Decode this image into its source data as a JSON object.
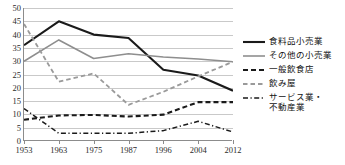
{
  "chart_data": {
    "type": "line",
    "title": "",
    "xlabel": "",
    "ylabel": "",
    "ylim": [
      0,
      50
    ],
    "ytick_step": 5,
    "yticks": [
      "0",
      "5",
      "10",
      "15",
      "20",
      "25",
      "30",
      "35",
      "40",
      "45",
      "50"
    ],
    "grid": true,
    "legend_position": "right",
    "categories": [
      "1953",
      "1963",
      "1975",
      "1987",
      "1996",
      "2004",
      "2012"
    ],
    "series": [
      {
        "name": "食料品小売業",
        "style": "solid",
        "color": "#1a1a1a",
        "width": 2.1,
        "values": [
          36.0,
          45.0,
          40.0,
          38.7,
          26.8,
          24.6,
          18.9
        ]
      },
      {
        "name": "その他の小売業",
        "style": "solid",
        "color": "#8e8e8e",
        "width": 1.6,
        "values": [
          30.0,
          38.0,
          31.0,
          32.8,
          31.6,
          30.8,
          29.8
        ]
      },
      {
        "name": "一般飲食店",
        "style": "dashed",
        "color": "#1a1a1a",
        "width": 2.1,
        "values": [
          8.0,
          9.6,
          9.8,
          9.2,
          9.9,
          14.6,
          14.6
        ]
      },
      {
        "name": "飲み屋",
        "style": "dashed",
        "color": "#9a9a9a",
        "width": 1.8,
        "values": [
          44.0,
          22.3,
          25.4,
          13.6,
          18.5,
          24.3,
          29.8
        ]
      },
      {
        "name": "サービス業・\n不動産業",
        "style": "dashdot",
        "color": "#1a1a1a",
        "width": 1.5,
        "values": [
          12.2,
          2.9,
          2.9,
          2.9,
          3.9,
          7.4,
          3.4
        ]
      }
    ]
  },
  "legend": {
    "items": [
      {
        "label": "食料品小売業",
        "sample": "solid-black-line-icon"
      },
      {
        "label": "その他の小売業",
        "sample": "solid-gray-line-icon"
      },
      {
        "label": "一般飲食店",
        "sample": "dashed-black-line-icon"
      },
      {
        "label": "飲み屋",
        "sample": "dashed-gray-line-icon"
      },
      {
        "label": "サービス業・\n不動産業",
        "sample": "dashdot-black-line-icon"
      }
    ]
  },
  "caption": {
    "text": ""
  }
}
